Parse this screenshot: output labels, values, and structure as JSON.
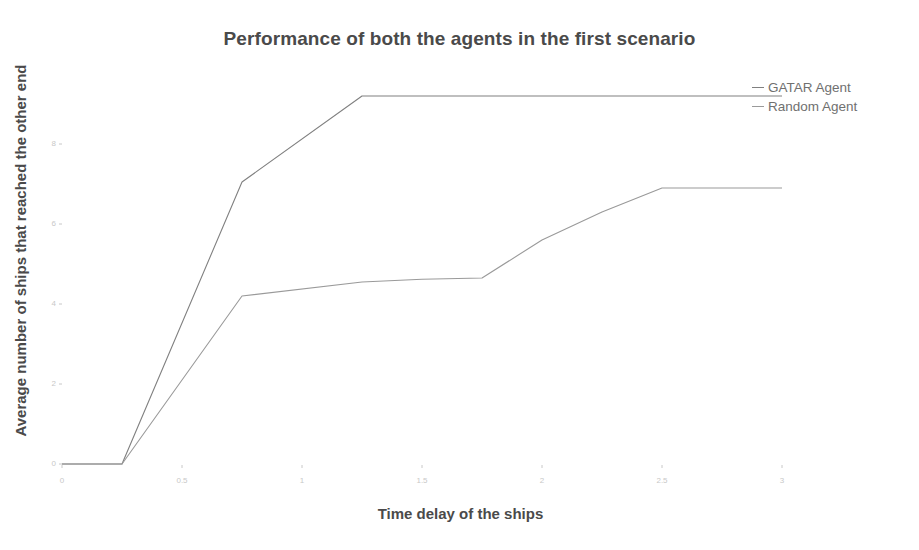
{
  "chart_data": {
    "type": "line",
    "title": "Performance of both the agents in the first scenario",
    "xlabel": "Time delay of the ships",
    "ylabel": "Average number of ships that reached the other end",
    "xlim": [
      0,
      3.05
    ],
    "ylim": [
      0,
      9.6
    ],
    "xticks": [
      "0",
      "0.5",
      "1",
      "1.5",
      "2",
      "2.5",
      "3"
    ],
    "xtick_values": [
      0,
      0.5,
      1,
      1.5,
      2,
      2.5,
      3
    ],
    "yticks": [
      "0",
      "2",
      "4",
      "6",
      "8"
    ],
    "ytick_values": [
      0,
      2,
      4,
      6,
      8
    ],
    "grid": false,
    "legend_position": "top-right",
    "x": [
      0,
      0.25,
      0.75,
      1.25,
      1.5,
      1.75,
      2.0,
      2.25,
      2.5,
      3.0
    ],
    "series": [
      {
        "name": "GATAR Agent",
        "color": "#808080",
        "values": [
          0,
          0,
          7.05,
          9.2,
          9.2,
          9.2,
          9.2,
          9.2,
          9.2,
          9.2
        ]
      },
      {
        "name": "Random Agent",
        "color": "#9a9a9a",
        "values": [
          0,
          0,
          4.2,
          4.55,
          4.62,
          4.65,
          5.6,
          6.3,
          6.9,
          6.9
        ]
      }
    ]
  },
  "legend": {
    "items": [
      {
        "label": "GATAR Agent"
      },
      {
        "label": "Random Agent"
      }
    ]
  },
  "colors": {
    "title": "#4a4a4a",
    "axis_label": "#4a4a4a",
    "tick": "#c8c8c8",
    "background": "#ffffff"
  }
}
